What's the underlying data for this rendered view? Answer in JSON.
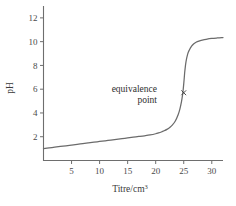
{
  "chart_data": {
    "type": "line",
    "title": "",
    "xlabel": "Titre/cm3",
    "xlabel_base": "Titre/cm",
    "xlabel_sup": "3",
    "ylabel": "pH",
    "xlim": [
      0,
      32
    ],
    "ylim": [
      0,
      13
    ],
    "grid": false,
    "legend": null,
    "xticks": [
      5,
      10,
      15,
      20,
      25,
      30
    ],
    "xtick_labels": [
      "5",
      "10",
      "15",
      "20",
      "25",
      "30"
    ],
    "yticks": [
      2,
      4,
      6,
      8,
      10,
      12
    ],
    "ytick_labels": [
      "2",
      "4",
      "6",
      "8",
      "10",
      "12"
    ],
    "series": [
      {
        "name": "titration-curve",
        "color": "#6b6b6b",
        "x": [
          0.0,
          1.0,
          2.0,
          3.0,
          4.0,
          5.0,
          6.0,
          7.0,
          8.0,
          9.0,
          10.0,
          11.0,
          12.0,
          13.0,
          14.0,
          15.0,
          16.0,
          17.0,
          18.0,
          19.0,
          20.0,
          20.5,
          21.0,
          21.5,
          22.0,
          22.5,
          23.0,
          23.5,
          24.0,
          24.3,
          24.6,
          24.8,
          24.9,
          25.0,
          25.1,
          25.2,
          25.4,
          25.7,
          26.0,
          26.4,
          26.8,
          27.2,
          27.7,
          28.3,
          29.0,
          30.0,
          31.0,
          32.0
        ],
        "y": [
          1.0,
          1.06,
          1.12,
          1.18,
          1.24,
          1.3,
          1.36,
          1.42,
          1.48,
          1.54,
          1.6,
          1.66,
          1.72,
          1.78,
          1.84,
          1.9,
          1.96,
          2.02,
          2.08,
          2.15,
          2.25,
          2.32,
          2.4,
          2.5,
          2.62,
          2.78,
          3.0,
          3.32,
          3.85,
          4.3,
          4.95,
          5.55,
          5.95,
          6.45,
          7.0,
          7.55,
          8.3,
          8.95,
          9.3,
          9.62,
          9.82,
          9.95,
          10.05,
          10.13,
          10.2,
          10.27,
          10.31,
          10.34
        ]
      }
    ],
    "annotations": [
      {
        "name": "equivalence-point",
        "line1": "equivalence",
        "line2": "point",
        "marker": "x",
        "marker_x": 25.0,
        "marker_y": 5.7
      }
    ]
  },
  "axis": {
    "color": "#6e6e6e"
  }
}
